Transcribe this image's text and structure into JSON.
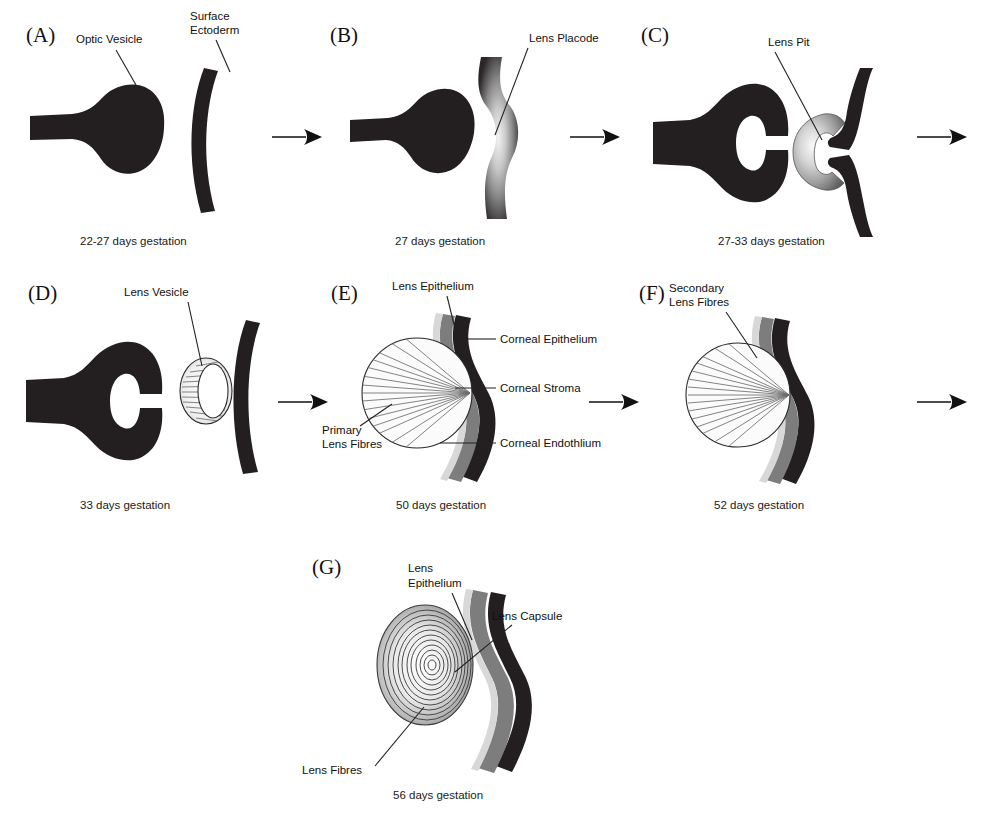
{
  "figure": {
    "panel_count": 7,
    "background_color": "#ffffff",
    "ink_color": "#231f20"
  },
  "palette": {
    "tissue_dark": "#231f20",
    "cornea_stroma": "#231f20",
    "cornea_gray": "#7d7d7d",
    "cornea_light": "#d8d8d8",
    "lens_fill": "#fbfbfb",
    "fibre_stroke": "#6e6e6e",
    "text": "#111111"
  },
  "panels": [
    {
      "id": "A",
      "letter": "(A)",
      "caption": "22-27 days gestation",
      "labels": [
        {
          "name": "optic-vesicle",
          "text": "Optic Vesicle"
        },
        {
          "name": "surface-ectoderm",
          "text": "Surface\nEctoderm",
          "lines": [
            "Surface",
            "Ectoderm"
          ]
        }
      ],
      "structures": [
        "optic vesicle",
        "surface ectoderm"
      ]
    },
    {
      "id": "B",
      "letter": "(B)",
      "caption": "27 days gestation",
      "labels": [
        {
          "name": "lens-placode",
          "text": "Lens Placode"
        }
      ],
      "structures": [
        "optic vesicle",
        "lens placode"
      ]
    },
    {
      "id": "C",
      "letter": "(C)",
      "caption": "27-33 days gestation",
      "labels": [
        {
          "name": "lens-pit",
          "text": "Lens Pit"
        }
      ],
      "structures": [
        "optic cup",
        "lens pit"
      ]
    },
    {
      "id": "D",
      "letter": "(D)",
      "caption": "33 days gestation",
      "labels": [
        {
          "name": "lens-vesicle",
          "text": "Lens Vesicle"
        }
      ],
      "structures": [
        "optic cup",
        "lens vesicle",
        "surface ectoderm"
      ]
    },
    {
      "id": "E",
      "letter": "(E)",
      "caption": "50 days gestation",
      "labels": [
        {
          "name": "lens-epithelium",
          "text": "Lens Epithelium"
        },
        {
          "name": "corneal-epithelium",
          "text": "Corneal Epithelium"
        },
        {
          "name": "corneal-stroma",
          "text": "Corneal Stroma"
        },
        {
          "name": "corneal-endothelium",
          "text": "Corneal Endothlium"
        },
        {
          "name": "primary-lens-fibres",
          "text": "Primary Lens Fibres",
          "lines": [
            "Primary",
            "Lens Fibres"
          ]
        }
      ],
      "structures": [
        "lens with primary fibres",
        "cornea three layers"
      ]
    },
    {
      "id": "F",
      "letter": "(F)",
      "caption": "52 days gestation",
      "labels": [
        {
          "name": "secondary-lens-fibres",
          "text": "Secondary Lens Fibres",
          "lines": [
            "Secondary",
            "Lens Fibres"
          ]
        }
      ],
      "structures": [
        "lens with secondary fibres",
        "cornea"
      ]
    },
    {
      "id": "G",
      "letter": "(G)",
      "caption": "56 days gestation",
      "labels": [
        {
          "name": "lens-epithelium",
          "text": "Lens Epithelium",
          "lines": [
            "Lens",
            "Epithelium"
          ]
        },
        {
          "name": "lens-capsule",
          "text": "Lens Capsule"
        },
        {
          "name": "lens-fibres",
          "text": "Lens Fibres"
        }
      ],
      "structures": [
        "lamellar lens",
        "lens capsule",
        "cornea"
      ]
    }
  ],
  "arrows": [
    {
      "name": "arrow-a-to-b",
      "from": "A",
      "to": "B"
    },
    {
      "name": "arrow-b-to-c",
      "from": "B",
      "to": "C"
    },
    {
      "name": "arrow-c-to-d",
      "from": "C",
      "to": "D"
    },
    {
      "name": "arrow-d-to-e",
      "from": "D",
      "to": "E"
    },
    {
      "name": "arrow-e-to-f",
      "from": "E",
      "to": "F"
    },
    {
      "name": "arrow-f-to-g",
      "from": "F",
      "to": "G"
    }
  ],
  "text": {
    "panel_a_letter": "(A)",
    "panel_b_letter": "(B)",
    "panel_c_letter": "(C)",
    "panel_d_letter": "(D)",
    "panel_e_letter": "(E)",
    "panel_f_letter": "(F)",
    "panel_g_letter": "(G)",
    "caption_a": "22-27 days gestation",
    "caption_b": "27 days gestation",
    "caption_c": "27-33 days gestation",
    "caption_d": "33 days gestation",
    "caption_e": "50 days gestation",
    "caption_f": "52 days gestation",
    "caption_g": "56 days gestation",
    "label_optic_vesicle": "Optic Vesicle",
    "label_surface_ectoderm_1": "Surface",
    "label_surface_ectoderm_2": "Ectoderm",
    "label_lens_placode": "Lens Placode",
    "label_lens_pit": "Lens Pit",
    "label_lens_vesicle": "Lens Vesicle",
    "label_lens_epithelium_e": "Lens Epithelium",
    "label_corneal_epithelium": "Corneal Epithelium",
    "label_corneal_stroma": "Corneal Stroma",
    "label_corneal_endothelium": "Corneal Endothlium",
    "label_primary_1": "Primary",
    "label_primary_2": "Lens Fibres",
    "label_secondary_1": "Secondary",
    "label_secondary_2": "Lens Fibres",
    "label_lens_epithelium_g_1": "Lens",
    "label_lens_epithelium_g_2": "Epithelium",
    "label_lens_capsule": "Lens Capsule",
    "label_lens_fibres": "Lens Fibres"
  }
}
